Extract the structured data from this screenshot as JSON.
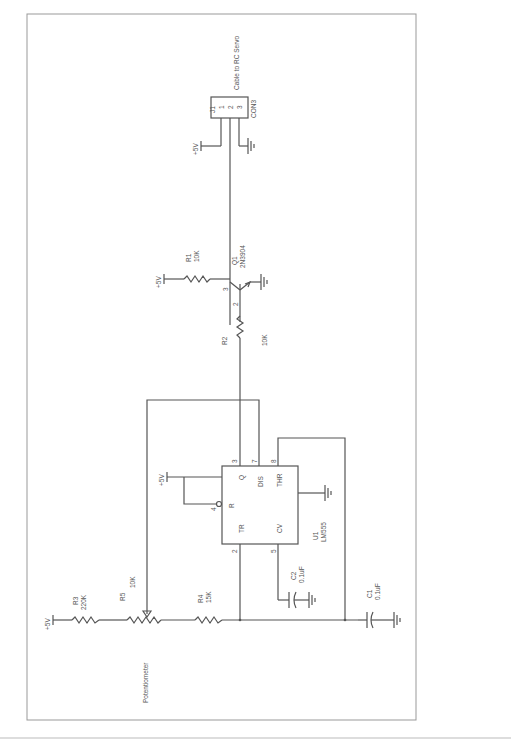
{
  "schematic": {
    "connector": {
      "ref": "J1",
      "part": "CON3",
      "description": "Cable to RC Servo",
      "pins": [
        "1",
        "2",
        "3"
      ]
    },
    "supply_label": "+5V",
    "transistor": {
      "ref": "Q1",
      "part": "2N3904",
      "pin_base": "2",
      "pin_collector": "3"
    },
    "resistors": [
      {
        "ref": "R1",
        "value": "10K"
      },
      {
        "ref": "R2",
        "value": "10K"
      },
      {
        "ref": "R3",
        "value": "220K"
      },
      {
        "ref": "R4",
        "value": "15K"
      },
      {
        "ref": "R5",
        "value": "10K"
      }
    ],
    "capacitors": [
      {
        "ref": "C1",
        "value": "0.1uF"
      },
      {
        "ref": "C2",
        "value": "0.1uF"
      }
    ],
    "ic": {
      "ref": "U1",
      "part": "LM555",
      "pins": {
        "Q": "3",
        "DIS": "7",
        "THR": "6",
        "TR": "2",
        "CV": "5",
        "R": "4",
        "THR_wire": "8"
      },
      "pin_labels": {
        "Q": "Q",
        "DIS": "DIS",
        "THR": "THR",
        "TR": "TR",
        "CV": "CV",
        "R": "R"
      }
    },
    "potentiometer_label": "Potentiometer"
  }
}
